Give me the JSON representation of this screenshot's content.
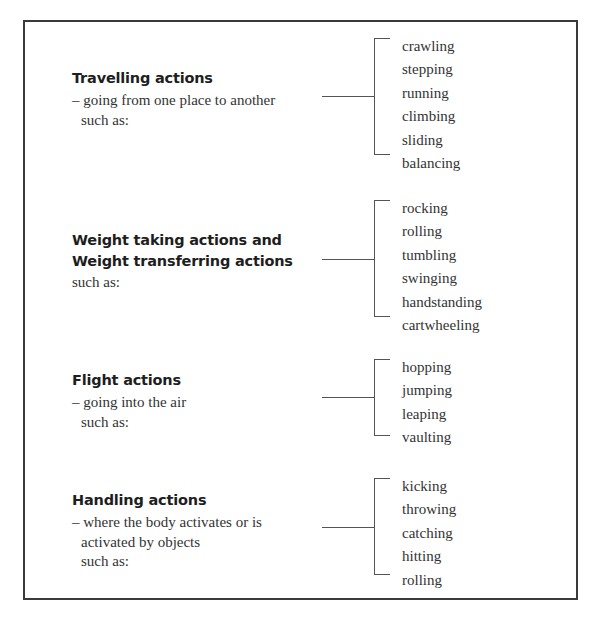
{
  "diagram": {
    "sections": [
      {
        "heading_lines": [
          "Travelling actions"
        ],
        "description_lines": [
          "– going from one place to another",
          "such as:"
        ],
        "description_indent": [
          false,
          true
        ],
        "items": [
          "crawling",
          "stepping",
          "running",
          "climbing",
          "sliding",
          "balancing"
        ]
      },
      {
        "heading_lines": [
          "Weight taking actions and",
          "Weight transferring actions"
        ],
        "description_lines": [
          "such as:"
        ],
        "description_indent": [
          false
        ],
        "items": [
          "rocking",
          "rolling",
          "tumbling",
          "swinging",
          "handstanding",
          "cartwheeling"
        ]
      },
      {
        "heading_lines": [
          "Flight actions"
        ],
        "description_lines": [
          "– going into the air",
          "such as:"
        ],
        "description_indent": [
          false,
          true
        ],
        "items": [
          "hopping",
          "jumping",
          "leaping",
          "vaulting"
        ]
      },
      {
        "heading_lines": [
          "Handling actions"
        ],
        "description_lines": [
          "– where the body activates or is",
          "activated by objects",
          "such as:"
        ],
        "description_indent": [
          false,
          true,
          true
        ],
        "items": [
          "kicking",
          "throwing",
          "catching",
          "hitting",
          "rolling"
        ]
      }
    ],
    "caption": "(caption text clipped at bottom edge — not legible)"
  },
  "colors": {
    "border": "#3a3a3a",
    "connector": "#555555",
    "text": "#333333",
    "heading": "#1e1e1e"
  }
}
